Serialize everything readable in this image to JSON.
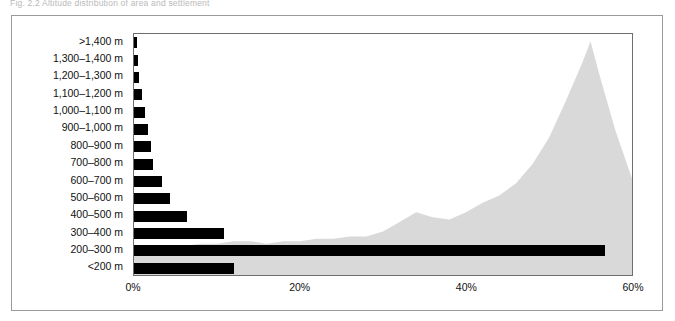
{
  "caption": {
    "text": "Fig. 2.2  Altitude distribution of area and settlement"
  },
  "chart_data": {
    "type": "bar",
    "orientation": "horizontal",
    "title": "",
    "xlabel": "",
    "ylabel": "",
    "categories": [
      ">1,400 m",
      "1,300–1,400 m",
      "1,200–1,300 m",
      "1,100–1,200 m",
      "1,000–1,100 m",
      "900–1,000 m",
      "800–900 m",
      "700–800 m",
      "600–700 m",
      "500–600 m",
      "400–500 m",
      "300–400 m",
      "200–300 m",
      "<200 m"
    ],
    "values": [
      0.3,
      0.5,
      0.6,
      0.9,
      1.3,
      1.7,
      2.0,
      2.3,
      3.3,
      4.3,
      6.3,
      10.8,
      56.5,
      12.0
    ],
    "value_unit": "%",
    "xlim": [
      0,
      60
    ],
    "xticks": [
      0,
      20,
      40,
      60
    ],
    "xtick_labels": [
      "0%",
      "20%",
      "40%",
      "60%"
    ],
    "grid": false,
    "legend": null,
    "bar_color": "#000000",
    "series": [
      {
        "name": "Share by altitude band",
        "type": "bar",
        "values": [
          0.3,
          0.5,
          0.6,
          0.9,
          1.3,
          1.7,
          2.0,
          2.3,
          3.3,
          4.3,
          6.3,
          10.8,
          56.5,
          12.0
        ]
      },
      {
        "name": "Background profile",
        "type": "area",
        "color": "#d9d9d9",
        "note": "Light grey silhouette profile rising to a peak near 55% on the x-axis",
        "x": [
          0,
          2,
          4,
          6,
          8,
          10,
          12,
          14,
          16,
          18,
          20,
          22,
          24,
          26,
          28,
          30,
          32,
          34,
          36,
          38,
          40,
          42,
          44,
          46,
          48,
          50,
          52,
          54,
          55,
          56,
          58,
          60
        ],
        "y": [
          10,
          11,
          12,
          12,
          13,
          13,
          14,
          14,
          13,
          14,
          14,
          15,
          15,
          16,
          16,
          18,
          22,
          26,
          24,
          23,
          26,
          30,
          33,
          38,
          46,
          57,
          72,
          88,
          97,
          84,
          60,
          40
        ]
      }
    ]
  },
  "axis": {
    "x_tick_labels": [
      "0%",
      "20%",
      "40%",
      "60%"
    ],
    "x_tick_positions_pct": [
      0,
      20,
      40,
      60
    ]
  },
  "colors": {
    "bar": "#000000",
    "area": "#d9d9d9",
    "frame": "#6e6e6e",
    "outer_frame": "#9a9a9a",
    "text": "#111111"
  }
}
